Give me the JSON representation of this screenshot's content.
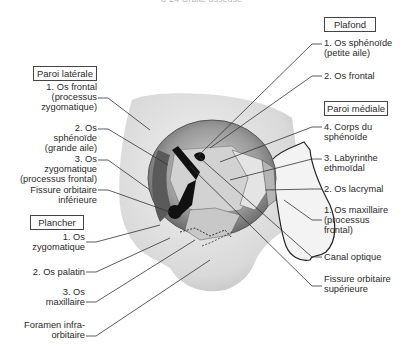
{
  "caption": "3-24 Orbite osseuse",
  "groups": {
    "lateral": {
      "title": "Paroi latérale",
      "items": [
        "1. Os frontal\n(processus\nzygomatique)",
        "2. Os\nsphénoïde\n(grande aile)",
        "3. Os\nzygomatique\n(processus frontal)",
        "Fissure orbitaire\ninférieure"
      ]
    },
    "floor": {
      "title": "Plancher",
      "items": [
        "1. Os\nzygomatique",
        "2. Os palatin",
        "3. Os\nmaxillaire",
        "Foramen infra-\norbitaire"
      ]
    },
    "roof": {
      "title": "Plafond",
      "items": [
        "1. Os sphénoïde\n(petite aile)",
        "2. Os frontal"
      ]
    },
    "medial": {
      "title": "Paroi médiale",
      "items": [
        "4. Corps du\nsphénoïde",
        "3. Labyrinthe\nethmoïdal",
        "2. Os lacrymal",
        "1. Os maxillaire\n(processus\nfrontal)"
      ]
    },
    "other": {
      "items": [
        "Canal optique",
        "Fissure orbitaire\nsupérieure"
      ]
    }
  },
  "colors": {
    "line": "#333333",
    "bone_light": "#e6e6e6",
    "bone_mid": "#bdbdbd",
    "bone_dark": "#7a7a7a",
    "hole": "#111111"
  }
}
